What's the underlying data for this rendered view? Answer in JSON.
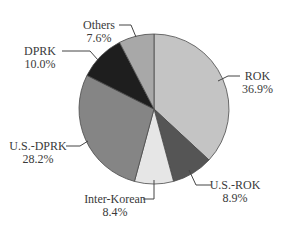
{
  "chart_data": {
    "type": "pie",
    "title": "",
    "start_angle_deg": 0,
    "direction": "clockwise",
    "slices": [
      {
        "label": "ROK",
        "value": 36.9,
        "display": "36.9%",
        "color": "#c4c4c4"
      },
      {
        "label": "U.S.-ROK",
        "value": 8.9,
        "display": "8.9%",
        "color": "#555555"
      },
      {
        "label": "Inter-Korean",
        "value": 8.4,
        "display": "8.4%",
        "color": "#e6e6e6"
      },
      {
        "label": "U.S.-DPRK",
        "value": 28.2,
        "display": "28.2%",
        "color": "#858585"
      },
      {
        "label": "DPRK",
        "value": 10.0,
        "display": "10.0%",
        "color": "#1e1e1e"
      },
      {
        "label": "Others",
        "value": 7.6,
        "display": "7.6%",
        "color": "#a8a8a8"
      }
    ],
    "legend": "none (direct labels with leader lines)"
  },
  "geometry": {
    "cx": 154,
    "cy": 109,
    "r": 75
  }
}
